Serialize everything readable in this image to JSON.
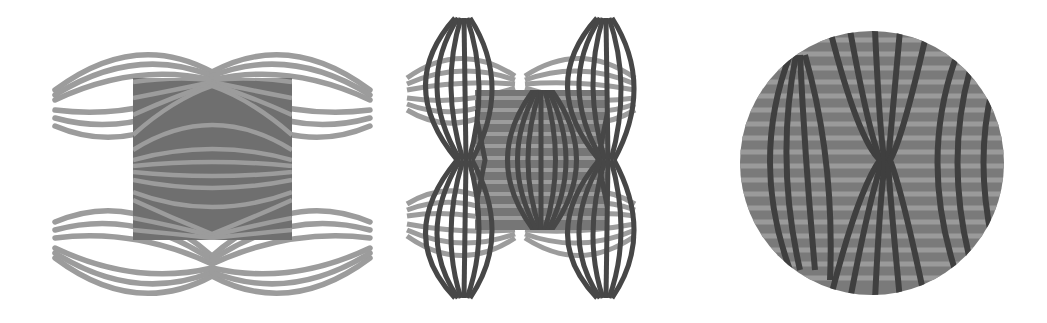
{
  "figures": [
    {
      "id": "panel-1",
      "description": "Two pairs of horizontal lens-shaped light-gray stripe bundles (top and bottom) with a dark gray square overlay; stripes inside the square converge to cusp points at top-center and bottom-center.",
      "colors": {
        "stripe": "#9c9c9c",
        "square": "#6f6f6f",
        "background": "#ffffff"
      },
      "bbox": [
        53,
        35,
        372,
        292
      ]
    },
    {
      "id": "panel-2",
      "description": "Four vertical lens-shaped dark stripe bundles at corners crossed by light-gray horizontal lens stripes; central gray square with vertical dark lens stripes converging top and bottom.",
      "colors": {
        "dark_stripe": "#474747",
        "light_stripe": "#9c9c9c",
        "square": "#767676",
        "background": "#ffffff"
      },
      "bbox": [
        405,
        18,
        640,
        300
      ]
    },
    {
      "id": "panel-3",
      "description": "Circular disc filled with gray horizontal stripes and dark vertical curved stripes that bow outward on left and right and pinch toward an hourglass point at center-right.",
      "colors": {
        "disc": "#7a7a7a",
        "light_stripe": "#999999",
        "dark_stripe": "#3f3f3f",
        "background": "#ffffff"
      },
      "center": [
        872,
        163
      ],
      "radius": 132
    }
  ]
}
